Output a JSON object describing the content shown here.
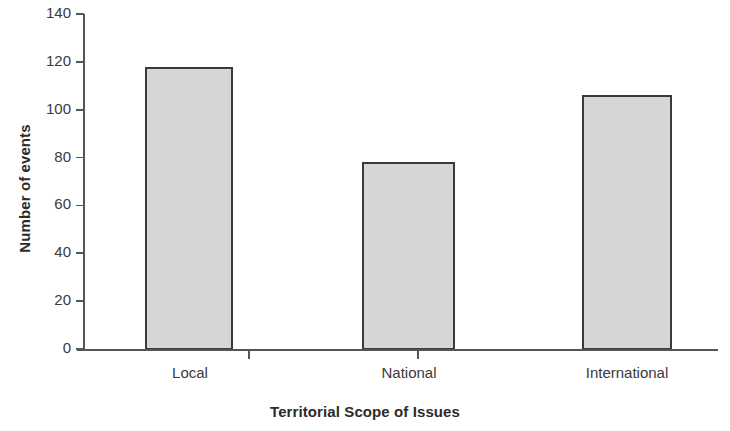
{
  "chart_data": {
    "type": "bar",
    "title": "",
    "xlabel": "Territorial Scope of Issues",
    "ylabel": "Number of events",
    "categories": [
      "Local",
      "National",
      "International"
    ],
    "values": [
      118,
      78,
      106
    ],
    "ylim": [
      0,
      140
    ],
    "yticks": [
      0,
      20,
      40,
      60,
      80,
      100,
      120,
      140
    ],
    "ytick_labels": [
      "0",
      "20",
      "40",
      "60",
      "80",
      "100",
      "120",
      "140"
    ],
    "grid": false,
    "legend": null,
    "bar_fill_color": "#d6d6d6",
    "bar_edge_color": "#3a3a3a",
    "axis_color": "#555555",
    "background_color": "#ffffff"
  },
  "axes": {
    "y_title": "Number of events",
    "x_title": "Territorial Scope of Issues"
  }
}
